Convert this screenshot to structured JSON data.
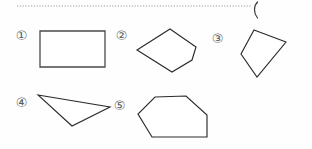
{
  "page": {
    "background_color": "#fefefe",
    "width": 312,
    "height": 149
  },
  "divider": {
    "name": "dotted-rule",
    "style": "dotted",
    "color": "#9a9a9a",
    "x1": 17,
    "x2": 252,
    "y": 6
  },
  "paren_mark": {
    "glyph": "(",
    "color": "#3a3a3a",
    "x": 254,
    "y": 4
  },
  "labels": [
    {
      "text": "①",
      "number": "1",
      "x": 14,
      "y": 28
    },
    {
      "text": "②",
      "number": "2",
      "x": 114,
      "y": 28
    },
    {
      "text": "③",
      "number": "3",
      "x": 210,
      "y": 31
    },
    {
      "text": "④",
      "number": "4",
      "x": 14,
      "y": 95
    },
    {
      "text": "⑤",
      "number": "5",
      "x": 112,
      "y": 98
    }
  ],
  "shapes": [
    {
      "id": "shape-1",
      "label": "1",
      "kind": "rectangle",
      "sides": 4,
      "stroke": "#4a4a4a",
      "fill": "#ffffff",
      "points": "40,31 105,31 105,67 40,67"
    },
    {
      "id": "shape-2",
      "label": "2",
      "kind": "pentagon",
      "sides": 5,
      "stroke": "#2b2b2b",
      "fill": "#ffffff",
      "points": "170,29 196,47 192,60 172,72 137,50"
    },
    {
      "id": "shape-3",
      "label": "3",
      "kind": "quadrilateral",
      "sides": 4,
      "stroke": "#2b2b2b",
      "fill": "#ffffff",
      "points": "254,30 286,42 257,77 241,54"
    },
    {
      "id": "shape-4",
      "label": "4",
      "kind": "triangle",
      "sides": 3,
      "stroke": "#2b2b2b",
      "fill": "#ffffff",
      "points": "38,95 110,107 72,126"
    },
    {
      "id": "shape-5",
      "label": "5",
      "kind": "hexagon",
      "sides": 6,
      "stroke": "#2b2b2b",
      "fill": "#ffffff",
      "points": "155,97 186,96 207,115 207,137 152,137 138,114"
    }
  ]
}
